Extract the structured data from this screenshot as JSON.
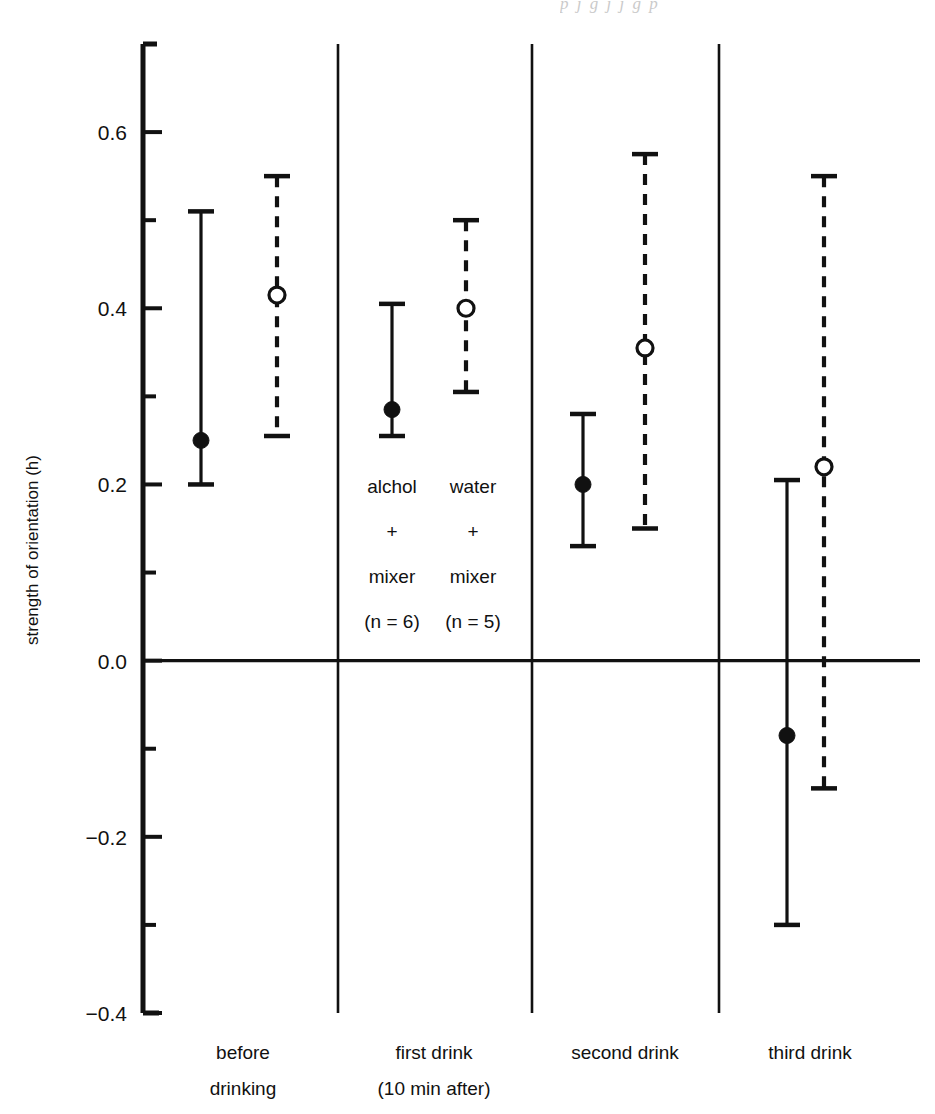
{
  "page": {
    "bleed_text": "p   j       g  j   j     g        p"
  },
  "chart_data": {
    "type": "scatter",
    "title": "",
    "xlabel": "",
    "ylabel": "strength of orientation (h)",
    "ylim": [
      -0.4,
      0.7
    ],
    "yticks": [
      0.6,
      0.4,
      0.2,
      0.0,
      -0.2,
      -0.4
    ],
    "ytick_labels": [
      "0.6",
      "0.4",
      "0.2",
      "0.0",
      "−0.2",
      "−0.4"
    ],
    "minor_ticks": [
      0.5,
      0.3,
      0.1,
      -0.1,
      -0.3
    ],
    "grid": false,
    "legend_position": "in-plot-annotation",
    "zero_line": 0.0,
    "categories": [
      "before drinking",
      "first drink (10 min after)",
      "second drink",
      "third drink"
    ],
    "category_labels": [
      [
        "before",
        "drinking"
      ],
      [
        "first drink",
        "(10 min after)"
      ],
      [
        "second drink",
        ""
      ],
      [
        "third drink",
        ""
      ]
    ],
    "series": [
      {
        "name": "alchol + mixer (n = 6)",
        "style": "solid",
        "marker": "filled-circle",
        "values": [
          0.25,
          0.285,
          0.2,
          -0.085
        ],
        "err_low": [
          0.2,
          0.255,
          0.13,
          -0.3
        ],
        "err_high": [
          0.51,
          0.405,
          0.28,
          0.205
        ]
      },
      {
        "name": "water + mixer (n = 5)",
        "style": "dashed",
        "marker": "open-circle",
        "values": [
          0.415,
          0.4,
          0.355,
          0.22
        ],
        "err_low": [
          0.255,
          0.305,
          0.15,
          -0.145
        ],
        "err_high": [
          0.55,
          0.5,
          0.575,
          0.55
        ]
      }
    ],
    "annotations": [
      {
        "id": "annot-alchol",
        "lines": [
          "alchol",
          "+",
          "mixer",
          "(n = 6)"
        ]
      },
      {
        "id": "annot-water",
        "lines": [
          "water",
          "+",
          "mixer",
          "(n = 5)"
        ]
      }
    ],
    "colors": {
      "ink": "#111111",
      "background": "#ffffff"
    }
  }
}
